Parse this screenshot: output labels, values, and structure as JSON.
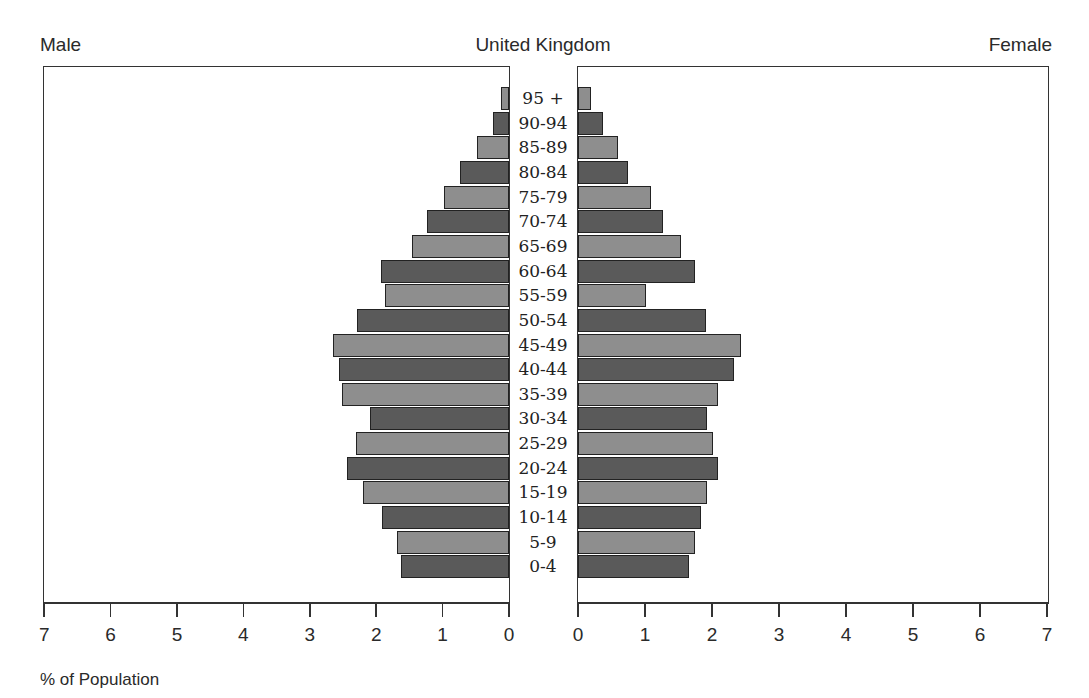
{
  "header": {
    "title": "United Kingdom",
    "left_label": "Male",
    "right_label": "Female"
  },
  "footer": {
    "axis_label": "% of Population"
  },
  "colors": {
    "dark_bar": "#5a5a5a",
    "light_bar": "#8e8e8e",
    "border": "#222222"
  },
  "chart_data": {
    "type": "bar",
    "subtype": "population-pyramid",
    "title": "United Kingdom",
    "xlabel": "% of Population",
    "ylabel": "",
    "xlim": [
      0,
      7
    ],
    "x_ticks": [
      0,
      1,
      2,
      3,
      4,
      5,
      6,
      7
    ],
    "legend": [],
    "grid": false,
    "categories": [
      "95 +",
      "90-94",
      "85-89",
      "80-84",
      "75-79",
      "70-74",
      "65-69",
      "60-64",
      "55-59",
      "50-54",
      "45-49",
      "40-44",
      "35-39",
      "30-34",
      "25-29",
      "20-24",
      "15-19",
      "10-14",
      "5-9",
      "0-4"
    ],
    "series": [
      {
        "name": "Male",
        "side": "left",
        "values": [
          0.12,
          0.24,
          0.48,
          0.74,
          0.98,
          1.23,
          1.46,
          1.93,
          1.87,
          2.29,
          2.65,
          2.56,
          2.51,
          2.09,
          2.3,
          2.44,
          2.2,
          1.91,
          1.69,
          1.63
        ]
      },
      {
        "name": "Female",
        "side": "right",
        "values": [
          0.19,
          0.37,
          0.6,
          0.75,
          1.09,
          1.27,
          1.54,
          1.75,
          1.01,
          1.91,
          2.43,
          2.33,
          2.09,
          1.93,
          2.01,
          2.09,
          1.93,
          1.84,
          1.75,
          1.66
        ]
      }
    ]
  }
}
